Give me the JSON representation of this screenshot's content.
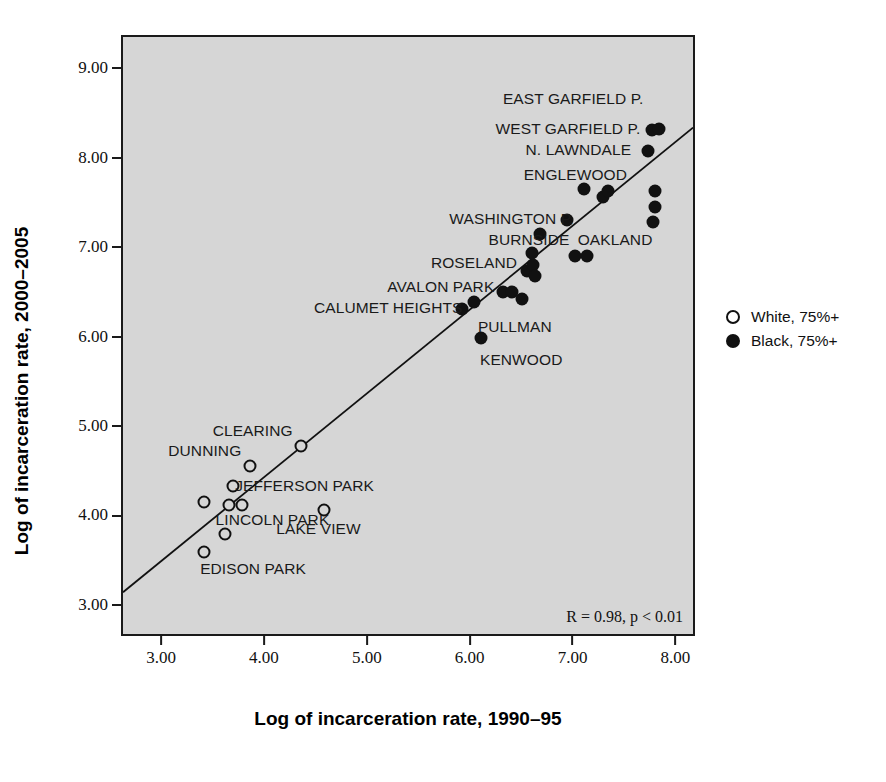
{
  "chart_data": {
    "type": "scatter",
    "title": "",
    "xlabel": "Log of incarceration rate, 1990–95",
    "ylabel": "Log of incarceration rate, 2000–2005",
    "xlim": [
      2.63,
      8.21
    ],
    "ylim": [
      2.63,
      9.35
    ],
    "xticks": [
      "3.00",
      "4.00",
      "5.00",
      "6.00",
      "7.00",
      "8.00"
    ],
    "xtick_values": [
      3,
      4,
      5,
      6,
      7,
      8
    ],
    "yticks": [
      "3.00",
      "4.00",
      "5.00",
      "6.00",
      "7.00",
      "8.00",
      "9.00"
    ],
    "ytick_values": [
      3,
      4,
      5,
      6,
      7,
      8,
      9
    ],
    "grid": false,
    "plot_background": "#d6d6d6",
    "annotation": "R = 0.98, p < 0.01",
    "legend_position": "right-outside",
    "legend": [
      {
        "marker": "open-circle",
        "label": "White, 75%+"
      },
      {
        "marker": "filled-circle",
        "label": "Black, 75%+"
      }
    ],
    "trendline": {
      "x": [
        2.63,
        8.21
      ],
      "y": [
        3.1,
        8.33
      ]
    },
    "series": [
      {
        "name": "White, 75%+",
        "marker": "open-circle",
        "points": [
          {
            "x": 3.42,
            "y": 4.15
          },
          {
            "x": 3.62,
            "y": 3.79
          },
          {
            "x": 3.66,
            "y": 4.12
          },
          {
            "x": 3.7,
            "y": 4.33
          },
          {
            "x": 3.79,
            "y": 4.12
          },
          {
            "x": 3.86,
            "y": 4.55
          },
          {
            "x": 3.42,
            "y": 3.59
          },
          {
            "x": 4.36,
            "y": 4.78
          },
          {
            "x": 4.58,
            "y": 4.06
          }
        ]
      },
      {
        "name": "Black, 75%+",
        "marker": "filled-circle",
        "points": [
          {
            "x": 5.93,
            "y": 6.31
          },
          {
            "x": 6.04,
            "y": 6.39
          },
          {
            "x": 6.11,
            "y": 5.98
          },
          {
            "x": 6.32,
            "y": 6.5
          },
          {
            "x": 6.41,
            "y": 6.5
          },
          {
            "x": 6.51,
            "y": 6.42
          },
          {
            "x": 6.56,
            "y": 6.73
          },
          {
            "x": 6.62,
            "y": 6.8
          },
          {
            "x": 6.64,
            "y": 6.68
          },
          {
            "x": 6.61,
            "y": 6.94
          },
          {
            "x": 6.68,
            "y": 7.15
          },
          {
            "x": 6.95,
            "y": 7.3
          },
          {
            "x": 7.02,
            "y": 6.9
          },
          {
            "x": 7.14,
            "y": 6.9
          },
          {
            "x": 7.11,
            "y": 7.65
          },
          {
            "x": 7.3,
            "y": 7.56
          },
          {
            "x": 7.34,
            "y": 7.63
          },
          {
            "x": 7.8,
            "y": 7.63
          },
          {
            "x": 7.8,
            "y": 7.45
          },
          {
            "x": 7.78,
            "y": 7.28
          },
          {
            "x": 7.73,
            "y": 8.08
          },
          {
            "x": 7.77,
            "y": 8.31
          },
          {
            "x": 7.84,
            "y": 8.32
          }
        ]
      }
    ],
    "point_labels": [
      {
        "text": "EAST GARFIELD P.",
        "x": 7.69,
        "y": 8.66,
        "align": "right"
      },
      {
        "text": "WEST GARFIELD P.",
        "x": 7.66,
        "y": 8.32,
        "align": "right"
      },
      {
        "text": "N. LAWNDALE",
        "x": 7.57,
        "y": 8.09,
        "align": "right"
      },
      {
        "text": "ENGLEWOOD",
        "x": 7.53,
        "y": 7.81,
        "align": "right"
      },
      {
        "text": "WASHINGTON P.",
        "x": 7.01,
        "y": 7.31,
        "align": "right"
      },
      {
        "text": "BURNSIDE",
        "x": 6.97,
        "y": 7.08,
        "align": "right"
      },
      {
        "text": "OAKLAND",
        "x": 7.05,
        "y": 7.08,
        "align": "left"
      },
      {
        "text": "ROSELAND",
        "x": 6.46,
        "y": 6.82,
        "align": "right"
      },
      {
        "text": "AVALON PARK",
        "x": 6.24,
        "y": 6.55,
        "align": "right"
      },
      {
        "text": "CALUMET HEIGHTS",
        "x": 5.93,
        "y": 6.32,
        "align": "right"
      },
      {
        "text": "PULLMAN",
        "x": 6.08,
        "y": 6.11,
        "align": "left"
      },
      {
        "text": "KENWOOD",
        "x": 6.1,
        "y": 5.74,
        "align": "left"
      },
      {
        "text": "CLEARING",
        "x": 4.28,
        "y": 4.95,
        "align": "right"
      },
      {
        "text": "DUNNING",
        "x": 3.78,
        "y": 4.72,
        "align": "right"
      },
      {
        "text": "JEFFERSON PARK",
        "x": 3.72,
        "y": 4.33,
        "align": "left"
      },
      {
        "text": "LINCOLN PARK",
        "x": 3.53,
        "y": 3.95,
        "align": "left"
      },
      {
        "text": "LAKE VIEW",
        "x": 4.12,
        "y": 3.85,
        "align": "left"
      },
      {
        "text": "EDISON PARK",
        "x": 3.38,
        "y": 3.4,
        "align": "left"
      }
    ]
  }
}
